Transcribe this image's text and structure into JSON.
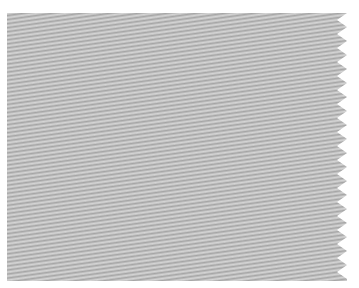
{
  "image": {
    "subject": "gray twill fabric swatch",
    "description": "Light gray woven twill fabric sample with diagonal weave lines and a pinked zig-zag right edge on a white background",
    "colors": {
      "background": "#ffffff",
      "fabric_base": "#b8b8b8",
      "fabric_light": "#d6d6d6",
      "fabric_dark": "#9a9a9a"
    },
    "edges": {
      "right": "pinked zig-zag",
      "left": "straight",
      "top": "straight",
      "bottom": "straight"
    }
  }
}
